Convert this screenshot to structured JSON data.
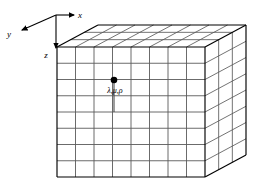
{
  "figure": {
    "type": "3d-lattice-grid-box",
    "background_color": "#ffffff",
    "line_color": "#000000",
    "grid_line_color": "#5a5a5a",
    "width": 264,
    "height": 191
  },
  "axes": {
    "origin": {
      "x": 56,
      "y": 15
    },
    "items": [
      {
        "name": "x",
        "label": "x",
        "label_x": 80,
        "label_y": 18,
        "direction": "right",
        "tip_x": 74,
        "tip_y": 15
      },
      {
        "name": "y",
        "label": "y",
        "label_x": 9,
        "label_y": 36,
        "direction": "down-left",
        "tip_x": 20,
        "tip_y": 31
      },
      {
        "name": "z",
        "label": "z",
        "label_x": 46,
        "label_y": 57,
        "direction": "down",
        "tip_x": 56,
        "tip_y": 50
      }
    ]
  },
  "box": {
    "front_face": {
      "left": 57,
      "top": 47,
      "right": 205,
      "bottom": 177,
      "columns": 8,
      "rows": 8
    },
    "depth": {
      "dx": 41,
      "dy": -22,
      "cells": 3
    }
  },
  "lattice_point": {
    "name": "lambda-mu-rho-point",
    "label": "λ,μ,ρ",
    "dot_x": 114,
    "dot_y": 80,
    "dot_radius": 3.2,
    "label_x": 115,
    "label_y": 93,
    "stem_bottom_y": 112
  }
}
